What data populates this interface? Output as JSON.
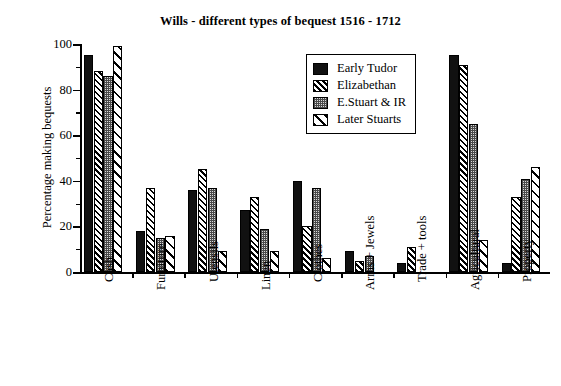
{
  "chart_data": {
    "type": "bar",
    "title": "Wills - different types of bequest 1516 - 1712",
    "xlabel": "",
    "ylabel": "Percentage making bequests",
    "ylim": [
      0,
      100
    ],
    "yticks": [
      0,
      20,
      40,
      60,
      80,
      100
    ],
    "yminor_step": 10,
    "grid": false,
    "legend_position": "top-center-right",
    "categories": [
      "Cash",
      "Furniture",
      "Utensils",
      "Linen",
      "Clothes",
      "Arms + Jewels",
      "Trade + tools",
      "Agricultural",
      "Property"
    ],
    "series": [
      {
        "name": "Early Tudor",
        "pattern": "solid-black",
        "values": [
          95,
          18,
          36,
          27,
          40,
          9,
          4,
          95,
          4
        ]
      },
      {
        "name": "Elizabethan",
        "pattern": "dense-diagonal",
        "values": [
          88,
          37,
          45,
          33,
          20,
          5,
          11,
          91,
          33
        ]
      },
      {
        "name": "E.Stuart & IR",
        "pattern": "fine-dotted",
        "values": [
          86,
          15,
          37,
          19,
          37,
          7,
          0,
          65,
          41
        ]
      },
      {
        "name": "Later Stuarts",
        "pattern": "wide-diagonal",
        "values": [
          99,
          16,
          9,
          9,
          6,
          0,
          0,
          14,
          46
        ]
      }
    ]
  },
  "legend": {
    "items": [
      {
        "label": "Early Tudor"
      },
      {
        "label": "Elizabethan"
      },
      {
        "label": "E.Stuart & IR"
      },
      {
        "label": "Later Stuarts"
      }
    ]
  }
}
